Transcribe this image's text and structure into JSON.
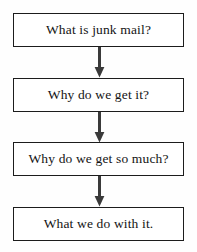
{
  "diagram": {
    "type": "flowchart",
    "orientation": "vertical",
    "colors": {
      "background": "#fefefe",
      "box_fill": "#ffffff",
      "box_border": "#1c1c1c",
      "arrow": "#3a3a3a",
      "text": "#141414"
    },
    "nodes": [
      {
        "id": "node-1",
        "label": "What is junk mail?"
      },
      {
        "id": "node-2",
        "label": "Why do we get it?"
      },
      {
        "id": "node-3",
        "label": "Why do we get so much?"
      },
      {
        "id": "node-4",
        "label": "What we do with it."
      }
    ],
    "connectors": [
      {
        "id": "arrow-1",
        "from": "node-1",
        "to": "node-2",
        "shape": "down-arrow"
      },
      {
        "id": "arrow-2",
        "from": "node-2",
        "to": "node-3",
        "shape": "down-arrow"
      },
      {
        "id": "arrow-3",
        "from": "node-3",
        "to": "node-4",
        "shape": "down-arrow"
      }
    ]
  }
}
